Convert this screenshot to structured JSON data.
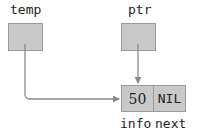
{
  "diagram": {
    "pointers": [
      {
        "name": "temp"
      },
      {
        "name": "ptr"
      }
    ],
    "node": {
      "info_value": "50",
      "next_value": "NIL",
      "info_label": "info",
      "next_label": "next"
    },
    "colors": {
      "box_fill": "#c9c9c9",
      "box_border": "#9a9a9a",
      "arrow": "#8a8a8a"
    }
  }
}
